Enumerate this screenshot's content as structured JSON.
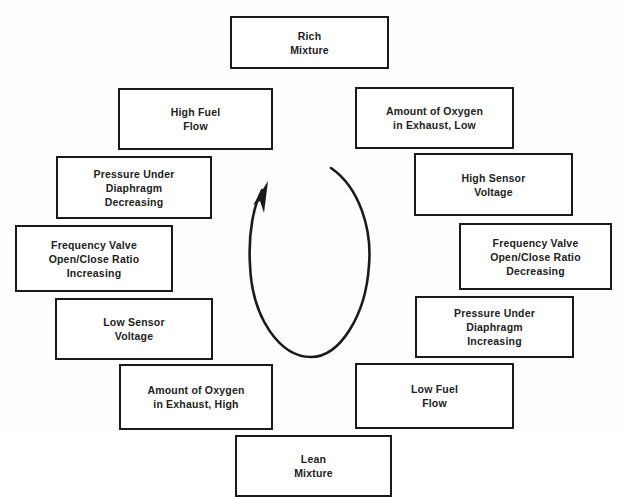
{
  "diagram": {
    "type": "cycle",
    "direction": "counterclockwise-arrow",
    "boxes": [
      {
        "id": "rich-mixture",
        "label": "Rich\nMixture"
      },
      {
        "id": "high-fuel-flow",
        "label": "High Fuel\nFlow"
      },
      {
        "id": "amount-oxygen-low",
        "label": "Amount of Oxygen\nin Exhaust, Low"
      },
      {
        "id": "pressure-decreasing",
        "label": "Pressure Under\nDiaphragm\nDecreasing"
      },
      {
        "id": "high-sensor-voltage",
        "label": "High Sensor\nVoltage"
      },
      {
        "id": "frequency-increasing",
        "label": "Frequency Valve\nOpen/Close Ratio\nIncreasing"
      },
      {
        "id": "frequency-decreasing",
        "label": "Frequency Valve\nOpen/Close Ratio\nDecreasing"
      },
      {
        "id": "low-sensor-voltage",
        "label": "Low Sensor\nVoltage"
      },
      {
        "id": "pressure-increasing",
        "label": "Pressure Under\nDiaphragm\nIncreasing"
      },
      {
        "id": "amount-oxygen-high",
        "label": "Amount of Oxygen\nin Exhaust, High"
      },
      {
        "id": "low-fuel-flow",
        "label": "Low Fuel\nFlow"
      },
      {
        "id": "lean-mixture",
        "label": "Lean\nMixture"
      }
    ],
    "colors": {
      "stroke": "#1a1a1a",
      "text": "#222222",
      "background": "#ffffff"
    }
  }
}
